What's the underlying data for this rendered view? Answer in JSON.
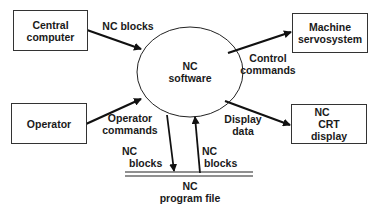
{
  "diagram": {
    "center_process": {
      "line1": "NC",
      "line2": "software"
    },
    "external_entities": [
      {
        "id": "central",
        "line1": "Central",
        "line2": "computer"
      },
      {
        "id": "servo",
        "line1": "Machine",
        "line2": "servosystem"
      },
      {
        "id": "operator",
        "line1": "Operator"
      },
      {
        "id": "crt",
        "line1": "NC",
        "line2": "CRT",
        "line3": "display"
      }
    ],
    "data_store": {
      "line1": "NC",
      "line2": "program file"
    },
    "flows": [
      {
        "from": "central",
        "to": "software",
        "line1": "NC blocks"
      },
      {
        "from": "software",
        "to": "servo",
        "line1": "Control",
        "line2": "commands"
      },
      {
        "from": "operator",
        "to": "software",
        "line1": "Operator",
        "line2": "commands"
      },
      {
        "from": "software",
        "to": "crt",
        "line1": "Display",
        "line2": "data"
      },
      {
        "from": "software",
        "to": "file",
        "line1": "NC",
        "line2": "blocks"
      },
      {
        "from": "file",
        "to": "software",
        "line1": "NC",
        "line2": "blocks"
      }
    ]
  }
}
